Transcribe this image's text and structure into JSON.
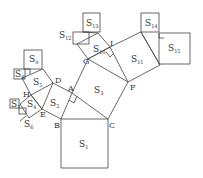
{
  "diagram": {
    "title": "",
    "points": {
      "A": "A",
      "B": "B",
      "C": "C",
      "D": "D",
      "E": "E",
      "F": "F",
      "G": "G",
      "H": "H",
      "I": "I"
    },
    "squares": [
      {
        "name": "S",
        "sub": "1"
      },
      {
        "name": "S",
        "sub": "2"
      },
      {
        "name": "S",
        "sub": "3"
      },
      {
        "name": "S",
        "sub": "4"
      },
      {
        "name": "S",
        "sub": "5"
      },
      {
        "name": "S",
        "sub": "6"
      },
      {
        "name": "S",
        "sub": "7"
      },
      {
        "name": "S",
        "sub": "8"
      },
      {
        "name": "S",
        "sub": "9"
      },
      {
        "name": "S",
        "sub": "10"
      },
      {
        "name": "S",
        "sub": "11"
      },
      {
        "name": "S",
        "sub": "12"
      },
      {
        "name": "S",
        "sub": "13"
      },
      {
        "name": "S",
        "sub": "14"
      },
      {
        "name": "S",
        "sub": "15"
      }
    ],
    "colors": {
      "line": "#444444",
      "text": "#333333",
      "background": "#ffffff"
    }
  }
}
